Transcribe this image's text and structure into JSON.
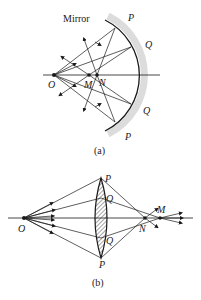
{
  "figure_a": {
    "caption": "(a)",
    "mirror_label": "Mirror",
    "points": {
      "O": "O",
      "M": "M",
      "N": "N"
    },
    "mirror_points": {
      "P_top": "P",
      "Q_top": "Q",
      "Q_bottom": "Q",
      "P_bottom": "P"
    }
  },
  "figure_b": {
    "caption": "(b)",
    "points": {
      "O": "O",
      "M": "M",
      "N": "N"
    },
    "lens_points": {
      "P_top": "P",
      "Q_top": "Q",
      "Q_bottom": "Q",
      "P_bottom": "P"
    }
  },
  "colors": {
    "line": "#1a1a1a",
    "mirror_shade": "#d9d9d9"
  }
}
